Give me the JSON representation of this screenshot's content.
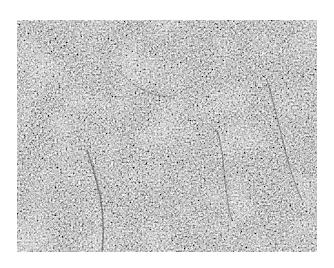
{
  "image": {
    "type": "grayscale histology micrograph",
    "description": "Dense cellular tissue section with scattered dark nuclei and lighter sinusoidal channels",
    "colors": {
      "background": "#ffffff",
      "tissue_mid": "#8a8a8a",
      "nuclei_dark": "#2a2a2a",
      "light_areas": "#d0d0d0"
    }
  }
}
